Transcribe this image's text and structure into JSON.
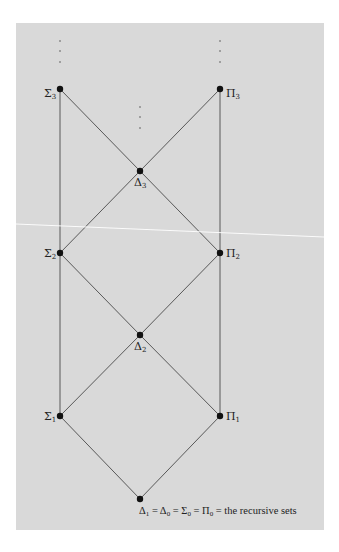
{
  "diagram": {
    "colors": {
      "panel": "#d9d9d9",
      "line": "#4a4a4a",
      "node": "#111111",
      "page": "#ffffff"
    },
    "nodes": [
      {
        "id": "sigma3",
        "symbol": "Σ",
        "index": "3",
        "x": 60,
        "y": 89,
        "label_side": "left"
      },
      {
        "id": "pi3",
        "symbol": "Π",
        "index": "3",
        "x": 220,
        "y": 89,
        "label_side": "right"
      },
      {
        "id": "delta3",
        "symbol": "Δ",
        "index": "3",
        "x": 140,
        "y": 171,
        "label_side": "below"
      },
      {
        "id": "sigma2",
        "symbol": "Σ",
        "index": "2",
        "x": 60,
        "y": 253,
        "label_side": "left"
      },
      {
        "id": "pi2",
        "symbol": "Π",
        "index": "2",
        "x": 220,
        "y": 253,
        "label_side": "right"
      },
      {
        "id": "delta2",
        "symbol": "Δ",
        "index": "2",
        "x": 140,
        "y": 335,
        "label_side": "below"
      },
      {
        "id": "sigma1",
        "symbol": "Σ",
        "index": "1",
        "x": 60,
        "y": 416,
        "label_side": "left"
      },
      {
        "id": "pi1",
        "symbol": "Π",
        "index": "1",
        "x": 220,
        "y": 416,
        "label_side": "right"
      },
      {
        "id": "base",
        "symbol": "Δ",
        "index": "1",
        "x": 140,
        "y": 499,
        "label_side": "below-right"
      }
    ],
    "edges": [
      [
        "sigma3",
        "sigma2"
      ],
      [
        "sigma2",
        "sigma1"
      ],
      [
        "pi3",
        "pi2"
      ],
      [
        "pi2",
        "pi1"
      ],
      [
        "sigma3",
        "delta3"
      ],
      [
        "pi3",
        "delta3"
      ],
      [
        "delta3",
        "sigma2"
      ],
      [
        "delta3",
        "pi2"
      ],
      [
        "sigma2",
        "delta2"
      ],
      [
        "pi2",
        "delta2"
      ],
      [
        "delta2",
        "sigma1"
      ],
      [
        "delta2",
        "pi1"
      ],
      [
        "sigma1",
        "base"
      ],
      [
        "pi1",
        "base"
      ]
    ],
    "continuation_dots": [
      {
        "above": "sigma3",
        "x": 60,
        "ys": [
          41,
          51,
          62
        ]
      },
      {
        "above": "pi3",
        "x": 220,
        "ys": [
          41,
          51,
          62
        ]
      },
      {
        "above": "delta3",
        "x": 140,
        "ys": [
          107,
          117,
          128
        ]
      }
    ],
    "labels": {
      "sigma3": {
        "sym": "Σ",
        "sub": "3"
      },
      "pi3": {
        "sym": "Π",
        "sub": "3"
      },
      "delta3": {
        "sym": "Δ",
        "sub": "3"
      },
      "sigma2": {
        "sym": "Σ",
        "sub": "2"
      },
      "pi2": {
        "sym": "Π",
        "sub": "2"
      },
      "delta2": {
        "sym": "Δ",
        "sub": "2"
      },
      "sigma1": {
        "sym": "Σ",
        "sub": "1"
      },
      "pi1": {
        "sym": "Π",
        "sub": "1"
      }
    },
    "caption": {
      "parts": [
        {
          "sym": "Δ",
          "sub": "1"
        },
        {
          "text": " = "
        },
        {
          "sym": "Δ",
          "sub": "0"
        },
        {
          "text": " = "
        },
        {
          "sym": "Σ",
          "sub": "0"
        },
        {
          "text": " = "
        },
        {
          "sym": "Π",
          "sub": "0"
        },
        {
          "text": " = the recursive sets"
        }
      ],
      "p0_sym": "Δ",
      "p0_sub": "1",
      "eq1": " = ",
      "p1_sym": "Δ",
      "p1_sub": "0",
      "eq2": " = ",
      "p2_sym": "Σ",
      "p2_sub": "0",
      "eq3": " = ",
      "p3_sym": "Π",
      "p3_sub": "0",
      "tail": " = the recursive sets"
    }
  }
}
